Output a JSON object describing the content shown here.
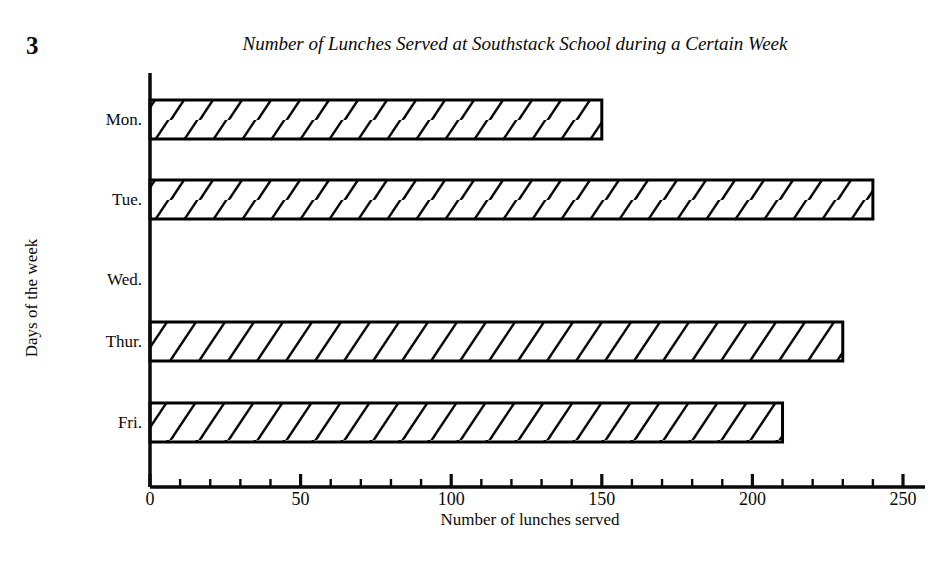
{
  "page": {
    "number": "3"
  },
  "chart_data": {
    "type": "bar",
    "orientation": "horizontal",
    "title": "Number of Lunches Served at Southstack School during a Certain Week",
    "xlabel": "Number of lunches served",
    "ylabel": "Days of the week",
    "categories": [
      "Mon.",
      "Tue.",
      "Wed.",
      "Thur.",
      "Fri."
    ],
    "values": [
      150,
      240,
      0,
      230,
      210
    ],
    "xlim": [
      0,
      250
    ],
    "xticks": [
      0,
      50,
      100,
      150,
      200,
      250
    ],
    "xtick_labels": [
      "0",
      "50",
      "100",
      "150",
      "200",
      "250"
    ],
    "minor_tick_interval": 10,
    "grid": false,
    "legend": false,
    "bar_style": {
      "fill": "#ffffff",
      "edge": "#000000",
      "hatch": "diagonal-forward-slash"
    }
  },
  "colors": {
    "ink": "#0a0a0a",
    "background": "#ffffff"
  }
}
